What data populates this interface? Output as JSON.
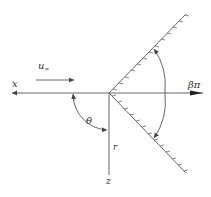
{
  "diagram": {
    "type": "wedge-flow-geometry",
    "colors": {
      "line": "#555555",
      "text": "#333333",
      "background": "#ffffff"
    },
    "labels": {
      "x_axis": "x",
      "freestream_base": "u",
      "freestream_sub": "∞",
      "angle_theta": "θ",
      "radial": "r",
      "z_axis": "z",
      "wedge_angle": "βπ"
    },
    "geometry": {
      "origin": [
        109,
        93
      ],
      "upper_wall_end": [
        186,
        14
      ],
      "lower_wall_end": [
        186,
        173
      ],
      "vertical_end": [
        109,
        175
      ],
      "x_axis_left": [
        10,
        93
      ],
      "x_axis_right": [
        203,
        93
      ]
    }
  }
}
